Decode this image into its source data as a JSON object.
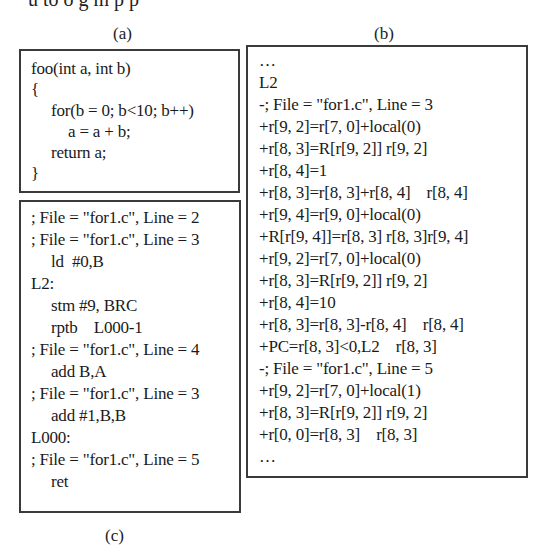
{
  "header_cut_text": "u   to o   g  m      p   p  ",
  "labels": {
    "a": "(a)",
    "b": "(b)",
    "c": "(c)"
  },
  "panel_a": {
    "lines": [
      "foo(int a, int b)",
      "{",
      "for(b = 0; b<10; b++)",
      "a = a + b;",
      "return a;",
      "}"
    ]
  },
  "panel_c": {
    "lines": [
      "; File = \"for1.c\", Line = 2",
      "; File = \"for1.c\", Line = 3",
      "ld  #0,B",
      "L2:",
      "stm #9, BRC",
      "rptb    L000-1",
      "; File = \"for1.c\", Line = 4",
      "add B,A",
      "; File = \"for1.c\", Line = 3",
      "add #1,B,B",
      "L000:",
      "; File = \"for1.c\", Line = 5",
      "ret"
    ]
  },
  "panel_b": {
    "lines": [
      "…",
      "L2",
      "-; File = \"for1.c\", Line = 3",
      "+r[9, 2]=r[7, 0]+local(0)",
      "+r[8, 3]=R[r[9, 2]] r[9, 2]",
      "+r[8, 4]=1",
      "+r[8, 3]=r[8, 3]+r[8, 4]    r[8, 4]",
      "+r[9, 4]=r[9, 0]+local(0)",
      "+R[r[9, 4]]=r[8, 3] r[8, 3]r[9, 4]",
      "+r[9, 2]=r[7, 0]+local(0)",
      "+r[8, 3]=R[r[9, 2]] r[9, 2]",
      "+r[8, 4]=10",
      "+r[8, 3]=r[8, 3]-r[8, 4]    r[8, 4]",
      "+PC=r[8, 3]<0,L2    r[8, 3]",
      "-; File = \"for1.c\", Line = 5",
      "+r[9, 2]=r[7, 0]+local(1)",
      "+r[8, 3]=R[r[9, 2]] r[9, 2]",
      "+r[0, 0]=r[8, 3]    r[8, 3]",
      "…"
    ]
  }
}
